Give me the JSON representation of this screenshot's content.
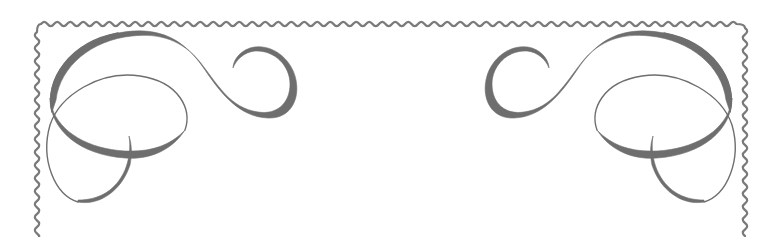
{
  "ornament": {
    "type": "decorative-frame-header",
    "background": "#ffffff",
    "border": {
      "style": "wavy",
      "color": "#7a7a7a",
      "sides_visible": [
        "top",
        "left",
        "right"
      ]
    },
    "flourishes": [
      {
        "position": "top-left",
        "color": "#6e6e6e"
      },
      {
        "position": "top-right",
        "color": "#6e6e6e",
        "mirrored": true
      }
    ]
  }
}
